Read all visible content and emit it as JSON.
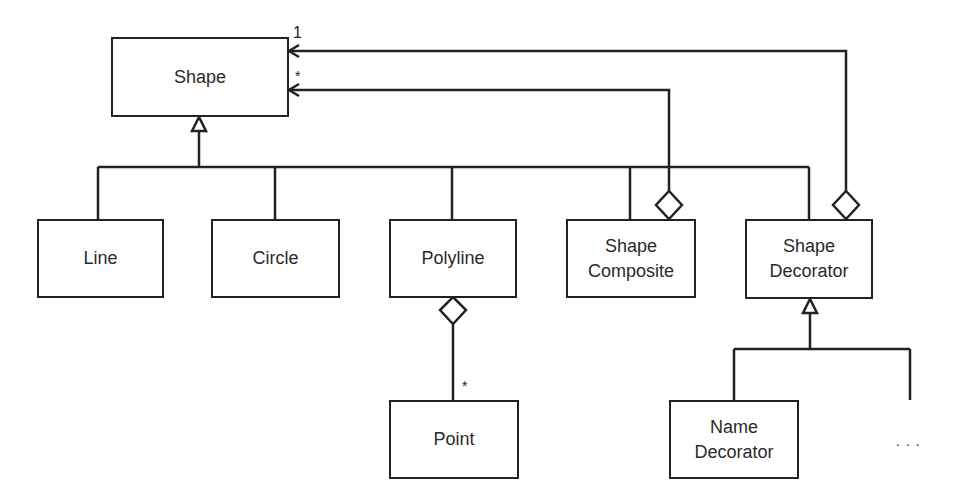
{
  "diagram": {
    "type": "uml-class-diagram",
    "classes": {
      "shape": {
        "name": "Shape"
      },
      "line": {
        "name": "Line"
      },
      "circle": {
        "name": "Circle"
      },
      "polyline": {
        "name": "Polyline"
      },
      "shape_composite": {
        "line1": "Shape",
        "line2": "Composite"
      },
      "shape_decorator": {
        "line1": "Shape",
        "line2": "Decorator"
      },
      "point": {
        "name": "Point"
      },
      "name_decorator": {
        "line1": "Name",
        "line2": "Decorator"
      }
    },
    "multiplicities": {
      "decorator_to_shape": "1",
      "composite_to_shape": "*",
      "polyline_to_point": "*"
    },
    "ellipsis": "...",
    "relationships": [
      {
        "type": "generalization",
        "from": "Line",
        "to": "Shape"
      },
      {
        "type": "generalization",
        "from": "Circle",
        "to": "Shape"
      },
      {
        "type": "generalization",
        "from": "Polyline",
        "to": "Shape"
      },
      {
        "type": "generalization",
        "from": "Shape Composite",
        "to": "Shape"
      },
      {
        "type": "generalization",
        "from": "Shape Decorator",
        "to": "Shape"
      },
      {
        "type": "aggregation",
        "from": "Shape Composite",
        "to": "Shape",
        "multiplicity": "*"
      },
      {
        "type": "aggregation",
        "from": "Shape Decorator",
        "to": "Shape",
        "multiplicity": "1"
      },
      {
        "type": "aggregation",
        "from": "Polyline",
        "to": "Point",
        "multiplicity": "*"
      },
      {
        "type": "generalization",
        "from": "Name Decorator",
        "to": "Shape Decorator"
      },
      {
        "type": "generalization",
        "from": "...",
        "to": "Shape Decorator"
      }
    ]
  }
}
